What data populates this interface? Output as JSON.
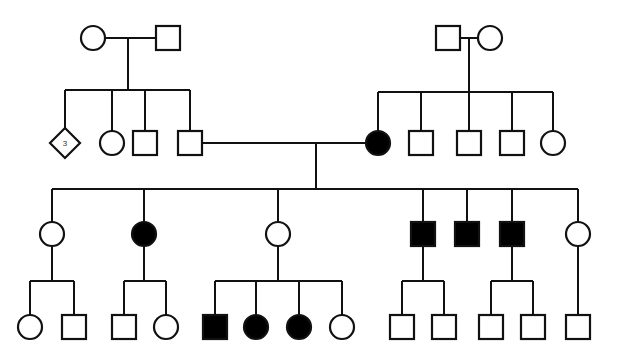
{
  "chart_data": {
    "type": "diagram",
    "subtitle": "Four-generation pedigree with affected individuals shaded solid black",
    "legend": {
      "square": "male",
      "circle": "female",
      "diamond": "unspecified sex / sibship group",
      "filled": "affected",
      "open": "unaffected"
    },
    "symbol_counts": {
      "total_individuals": 39,
      "affected_total": 9,
      "affected_males": 4,
      "affected_females": 5,
      "unaffected_total": 29,
      "diamond_groups": 1
    },
    "generations": [
      {
        "id": "I",
        "label": "Generation I",
        "individuals": [
          {
            "id": "I-1",
            "sex": "female",
            "shape": "circle",
            "affected": false,
            "x": 93,
            "y": 38
          },
          {
            "id": "I-2",
            "sex": "male",
            "shape": "square",
            "affected": false,
            "x": 168,
            "y": 38
          },
          {
            "id": "I-3",
            "sex": "male",
            "shape": "square",
            "affected": false,
            "x": 448,
            "y": 38
          },
          {
            "id": "I-4",
            "sex": "female",
            "shape": "circle",
            "affected": false,
            "x": 490,
            "y": 38
          }
        ]
      },
      {
        "id": "II",
        "label": "Generation II",
        "individuals": [
          {
            "id": "II-1",
            "sex": "unknown",
            "shape": "diamond",
            "affected": false,
            "x": 65,
            "y": 143,
            "count_label": "3"
          },
          {
            "id": "II-2",
            "sex": "female",
            "shape": "circle",
            "affected": false,
            "x": 112,
            "y": 143
          },
          {
            "id": "II-3",
            "sex": "male",
            "shape": "square",
            "affected": false,
            "x": 145,
            "y": 143
          },
          {
            "id": "II-4",
            "sex": "male",
            "shape": "square",
            "affected": false,
            "x": 190,
            "y": 143
          },
          {
            "id": "II-5",
            "sex": "female",
            "shape": "circle",
            "affected": true,
            "x": 378,
            "y": 143
          },
          {
            "id": "II-6",
            "sex": "male",
            "shape": "square",
            "affected": false,
            "x": 421,
            "y": 143
          },
          {
            "id": "II-7",
            "sex": "male",
            "shape": "square",
            "affected": false,
            "x": 469,
            "y": 143
          },
          {
            "id": "II-8",
            "sex": "male",
            "shape": "square",
            "affected": false,
            "x": 512,
            "y": 143
          },
          {
            "id": "II-9",
            "sex": "female",
            "shape": "circle",
            "affected": false,
            "x": 553,
            "y": 143
          }
        ]
      },
      {
        "id": "III",
        "label": "Generation III",
        "individuals": [
          {
            "id": "III-1",
            "sex": "female",
            "shape": "circle",
            "affected": false,
            "x": 52,
            "y": 234
          },
          {
            "id": "III-2",
            "sex": "female",
            "shape": "circle",
            "affected": true,
            "x": 144,
            "y": 234
          },
          {
            "id": "III-3",
            "sex": "female",
            "shape": "circle",
            "affected": false,
            "x": 278,
            "y": 234
          },
          {
            "id": "III-4",
            "sex": "male",
            "shape": "square",
            "affected": true,
            "x": 423,
            "y": 234
          },
          {
            "id": "III-5",
            "sex": "male",
            "shape": "square",
            "affected": true,
            "x": 467,
            "y": 234
          },
          {
            "id": "III-6",
            "sex": "male",
            "shape": "square",
            "affected": true,
            "x": 512,
            "y": 234
          },
          {
            "id": "III-7",
            "sex": "female",
            "shape": "circle",
            "affected": false,
            "x": 578,
            "y": 234
          }
        ]
      },
      {
        "id": "IV",
        "label": "Generation IV",
        "individuals": [
          {
            "id": "IV-1",
            "sex": "female",
            "shape": "circle",
            "affected": false,
            "x": 30,
            "y": 327
          },
          {
            "id": "IV-2",
            "sex": "male",
            "shape": "square",
            "affected": false,
            "x": 74,
            "y": 327
          },
          {
            "id": "IV-3",
            "sex": "male",
            "shape": "square",
            "affected": false,
            "x": 124,
            "y": 327
          },
          {
            "id": "IV-4",
            "sex": "female",
            "shape": "circle",
            "affected": false,
            "x": 166,
            "y": 327
          },
          {
            "id": "IV-5",
            "sex": "male",
            "shape": "square",
            "affected": true,
            "x": 215,
            "y": 327
          },
          {
            "id": "IV-6",
            "sex": "female",
            "shape": "circle",
            "affected": true,
            "x": 256,
            "y": 327
          },
          {
            "id": "IV-7",
            "sex": "female",
            "shape": "circle",
            "affected": true,
            "x": 299,
            "y": 327
          },
          {
            "id": "IV-8",
            "sex": "female",
            "shape": "circle",
            "affected": false,
            "x": 342,
            "y": 327
          },
          {
            "id": "IV-9",
            "sex": "male",
            "shape": "square",
            "affected": false,
            "x": 402,
            "y": 327
          },
          {
            "id": "IV-10",
            "sex": "male",
            "shape": "square",
            "affected": false,
            "x": 444,
            "y": 327
          },
          {
            "id": "IV-11",
            "sex": "male",
            "shape": "square",
            "affected": false,
            "x": 491,
            "y": 327
          },
          {
            "id": "IV-12",
            "sex": "male",
            "shape": "square",
            "affected": false,
            "x": 533,
            "y": 327
          },
          {
            "id": "IV-13",
            "sex": "male",
            "shape": "square",
            "affected": false,
            "x": 578,
            "y": 327
          }
        ]
      }
    ],
    "matings": [
      {
        "id": "M1",
        "partners": [
          "I-1",
          "I-2"
        ],
        "line_y": 38,
        "descent_x": 128,
        "children": [
          "II-1",
          "II-2",
          "II-3",
          "II-4"
        ]
      },
      {
        "id": "M2",
        "partners": [
          "I-3",
          "I-4"
        ],
        "line_y": 38,
        "descent_x": 469,
        "children": [
          "II-5",
          "II-6",
          "II-7",
          "II-8",
          "II-9"
        ]
      },
      {
        "id": "M3",
        "partners": [
          "II-4",
          "II-5"
        ],
        "line_y": 143,
        "descent_x": 316,
        "children": [
          "III-1",
          "III-2",
          "III-3",
          "III-4",
          "III-5",
          "III-6",
          "III-7"
        ]
      },
      {
        "id": "M4",
        "partners": [
          "III-1"
        ],
        "line_y": 234,
        "descent_x": 52,
        "children": [
          "IV-1",
          "IV-2"
        ]
      },
      {
        "id": "M5",
        "partners": [
          "III-2"
        ],
        "line_y": 234,
        "descent_x": 144,
        "children": [
          "IV-3",
          "IV-4"
        ]
      },
      {
        "id": "M6",
        "partners": [
          "III-3"
        ],
        "line_y": 234,
        "descent_x": 278,
        "children": [
          "IV-5",
          "IV-6",
          "IV-7",
          "IV-8"
        ]
      },
      {
        "id": "M7",
        "partners": [
          "III-4"
        ],
        "line_y": 234,
        "descent_x": 423,
        "children": [
          "IV-9",
          "IV-10"
        ]
      },
      {
        "id": "M8",
        "partners": [
          "III-6"
        ],
        "line_y": 234,
        "descent_x": 512,
        "children": [
          "IV-11",
          "IV-12"
        ]
      },
      {
        "id": "M9",
        "partners": [
          "III-7"
        ],
        "line_y": 234,
        "descent_x": 578,
        "children": [
          "IV-13"
        ]
      }
    ],
    "colors": {
      "stroke": "#111111",
      "affected_fill": "#000000",
      "unaffected_fill": "#ffffff",
      "background": "#ffffff",
      "label_text": "#333333"
    },
    "geometry": {
      "square_size": 24,
      "circle_radius": 12,
      "diamond_half": 15,
      "generation_y": [
        38,
        143,
        234,
        327
      ],
      "sibship_bar_y": [
        96,
        96,
        187,
        290
      ],
      "canvas": [
        618,
        357
      ]
    }
  }
}
